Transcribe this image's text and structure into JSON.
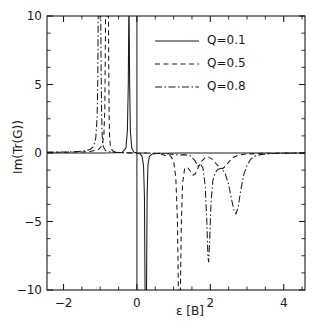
{
  "chart_data": {
    "type": "line",
    "title": "",
    "xlabel": "ε [B]",
    "ylabel": "Im(Tr(G))",
    "xlim": [
      -2.45,
      4.58
    ],
    "ylim": [
      -10,
      10
    ],
    "xticks": [
      -2,
      0,
      2,
      4
    ],
    "xtick_labels": [
      "−2",
      "0",
      "2",
      "4"
    ],
    "yticks": [
      -10,
      -5,
      0,
      5,
      10
    ],
    "ytick_labels": [
      "−10",
      "−5",
      "0",
      "5",
      "10"
    ],
    "x_minor_tick_step": 0.5,
    "y_minor_tick_step": 1.25,
    "grid": false,
    "legend_position": "upper right",
    "axis_color": "#1a1a1a",
    "series": [
      {
        "name": "Q=0.1",
        "label": "Q=0.1",
        "style": "solid",
        "color": "#1a1a1a",
        "dash": "none",
        "points": [
          [
            -2.45,
            0.0
          ],
          [
            -1.6,
            0.0
          ],
          [
            -1.0,
            0.0
          ],
          [
            -0.6,
            0.02
          ],
          [
            -0.4,
            0.05
          ],
          [
            -0.3,
            0.35
          ],
          [
            -0.26,
            1.6
          ],
          [
            -0.235,
            5.0
          ],
          [
            -0.222,
            10.0
          ],
          [
            -0.212,
            10.0
          ],
          [
            -0.198,
            5.0
          ],
          [
            -0.178,
            1.6
          ],
          [
            -0.14,
            0.35
          ],
          [
            -0.08,
            0.06
          ],
          [
            0.0,
            0.0
          ],
          [
            0.08,
            -0.05
          ],
          [
            0.14,
            -0.25
          ],
          [
            0.18,
            -0.9
          ],
          [
            0.205,
            -3.2
          ],
          [
            0.222,
            -10.0
          ],
          [
            0.262,
            -10.0
          ],
          [
            0.278,
            -3.2
          ],
          [
            0.3,
            -0.9
          ],
          [
            0.34,
            -0.25
          ],
          [
            0.42,
            -0.07
          ],
          [
            0.6,
            -0.02
          ],
          [
            1.2,
            0.0
          ],
          [
            2.4,
            0.0
          ],
          [
            4.58,
            0.0
          ]
        ]
      },
      {
        "name": "Q=0.5",
        "label": "Q=0.5",
        "style": "dashed",
        "color": "#1a1a1a",
        "dash": "5,3.5",
        "points": [
          [
            -2.45,
            0.05
          ],
          [
            -1.9,
            0.06
          ],
          [
            -1.5,
            0.08
          ],
          [
            -1.25,
            0.12
          ],
          [
            -1.05,
            0.25
          ],
          [
            -0.95,
            0.55
          ],
          [
            -0.9,
            1.3
          ],
          [
            -0.875,
            3.2
          ],
          [
            -0.862,
            7.0
          ],
          [
            -0.855,
            10.0
          ],
          [
            -0.775,
            10.0
          ],
          [
            -0.768,
            6.5
          ],
          [
            -0.758,
            3.0
          ],
          [
            -0.745,
            1.2
          ],
          [
            -0.72,
            0.45
          ],
          [
            -0.66,
            0.15
          ],
          [
            -0.55,
            0.05
          ],
          [
            -0.3,
            0.01
          ],
          [
            0.0,
            0.0
          ],
          [
            0.35,
            -0.01
          ],
          [
            0.55,
            -0.04
          ],
          [
            0.7,
            -0.12
          ],
          [
            0.8,
            -0.18
          ],
          [
            0.86,
            -0.15
          ],
          [
            0.92,
            -0.22
          ],
          [
            1.0,
            -0.6
          ],
          [
            1.06,
            -1.8
          ],
          [
            1.105,
            -5.0
          ],
          [
            1.13,
            -10.0
          ],
          [
            1.185,
            -10.0
          ],
          [
            1.21,
            -5.2
          ],
          [
            1.245,
            -2.2
          ],
          [
            1.3,
            -1.15
          ],
          [
            1.38,
            -1.05
          ],
          [
            1.46,
            -1.35
          ],
          [
            1.53,
            -1.62
          ],
          [
            1.6,
            -1.5
          ],
          [
            1.68,
            -1.0
          ],
          [
            1.76,
            -0.62
          ],
          [
            1.85,
            -0.38
          ],
          [
            1.95,
            -0.3
          ],
          [
            2.05,
            -0.45
          ],
          [
            2.15,
            -0.75
          ],
          [
            2.25,
            -1.05
          ],
          [
            2.33,
            -1.15
          ],
          [
            2.42,
            -0.95
          ],
          [
            2.52,
            -0.6
          ],
          [
            2.62,
            -0.33
          ],
          [
            2.75,
            -0.17
          ],
          [
            2.95,
            -0.08
          ],
          [
            3.3,
            -0.03
          ],
          [
            3.9,
            -0.01
          ],
          [
            4.58,
            0.0
          ]
        ]
      },
      {
        "name": "Q=0.8",
        "label": "Q=0.8",
        "style": "dashdot",
        "color": "#1a1a1a",
        "dash": "7,2.5,1.5,2.5",
        "points": [
          [
            -2.45,
            0.06
          ],
          [
            -2.0,
            0.07
          ],
          [
            -1.7,
            0.09
          ],
          [
            -1.45,
            0.14
          ],
          [
            -1.28,
            0.25
          ],
          [
            -1.18,
            0.5
          ],
          [
            -1.12,
            1.1
          ],
          [
            -1.085,
            2.6
          ],
          [
            -1.065,
            5.5
          ],
          [
            -1.055,
            10.0
          ],
          [
            -0.985,
            10.0
          ],
          [
            -0.975,
            6.0
          ],
          [
            -0.962,
            2.8
          ],
          [
            -0.945,
            1.2
          ],
          [
            -0.915,
            0.45
          ],
          [
            -0.85,
            0.16
          ],
          [
            -0.72,
            0.06
          ],
          [
            -0.4,
            0.02
          ],
          [
            0.0,
            0.0
          ],
          [
            0.4,
            -0.01
          ],
          [
            0.7,
            -0.03
          ],
          [
            0.95,
            -0.09
          ],
          [
            1.15,
            -0.15
          ],
          [
            1.3,
            -0.12
          ],
          [
            1.45,
            -0.2
          ],
          [
            1.58,
            -0.55
          ],
          [
            1.66,
            -0.95
          ],
          [
            1.73,
            -0.8
          ],
          [
            1.8,
            -1.1
          ],
          [
            1.86,
            -2.4
          ],
          [
            1.905,
            -5.0
          ],
          [
            1.935,
            -7.6
          ],
          [
            1.955,
            -7.95
          ],
          [
            1.985,
            -6.2
          ],
          [
            2.02,
            -3.6
          ],
          [
            2.07,
            -2.0
          ],
          [
            2.13,
            -1.45
          ],
          [
            2.21,
            -1.18
          ],
          [
            2.3,
            -1.12
          ],
          [
            2.4,
            -1.45
          ],
          [
            2.5,
            -2.3
          ],
          [
            2.58,
            -3.4
          ],
          [
            2.65,
            -4.25
          ],
          [
            2.7,
            -4.45
          ],
          [
            2.76,
            -3.9
          ],
          [
            2.83,
            -2.7
          ],
          [
            2.91,
            -1.6
          ],
          [
            3.0,
            -0.9
          ],
          [
            3.1,
            -0.45
          ],
          [
            3.22,
            -0.22
          ],
          [
            3.4,
            -0.1
          ],
          [
            3.7,
            -0.04
          ],
          [
            4.1,
            -0.02
          ],
          [
            4.58,
            -0.01
          ]
        ]
      }
    ],
    "legend": [
      {
        "label": "Q=0.1",
        "style": "solid"
      },
      {
        "label": "Q=0.5",
        "style": "dashed"
      },
      {
        "label": "Q=0.8",
        "style": "dashdot"
      }
    ]
  },
  "axes_geometry": {
    "left_px": 47,
    "right_px": 305,
    "top_px": 16,
    "bottom_px": 290
  },
  "legend_box": {
    "sample_x1_px": 155,
    "sample_x2_px": 199,
    "label_x_px": 207,
    "rows_y_px": [
      41,
      64,
      87
    ]
  }
}
